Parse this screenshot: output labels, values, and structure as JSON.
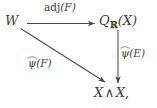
{
  "figure": {
    "type": "commutative-diagram",
    "background_color": "#ffffff",
    "ink_color": "#3d3d3d",
    "width": 157,
    "height": 108
  },
  "nodes": {
    "source": {
      "name": "W",
      "text": "W"
    },
    "target_upper_right": {
      "base": "Q",
      "subscript": "ℝ",
      "argument": "(X)"
    },
    "target_bottom": {
      "left": "X",
      "operator": "∧",
      "right": "X",
      "punctuation": ","
    }
  },
  "edges": {
    "horizontal": {
      "label_prefix": "adj",
      "label_arg": "(F)",
      "from": "W",
      "to": "Q_R(X)",
      "direction": "right"
    },
    "vertical": {
      "label_base": "ψ",
      "label_accent": "widehat",
      "label_arg": "(E)",
      "from": "Q_R(X)",
      "to": "X ∧ X",
      "direction": "down"
    },
    "diagonal": {
      "label_base": "ψ",
      "label_accent": "widehat",
      "label_arg": "(F)",
      "from": "W",
      "to": "X ∧ X",
      "direction": "down-right"
    }
  }
}
